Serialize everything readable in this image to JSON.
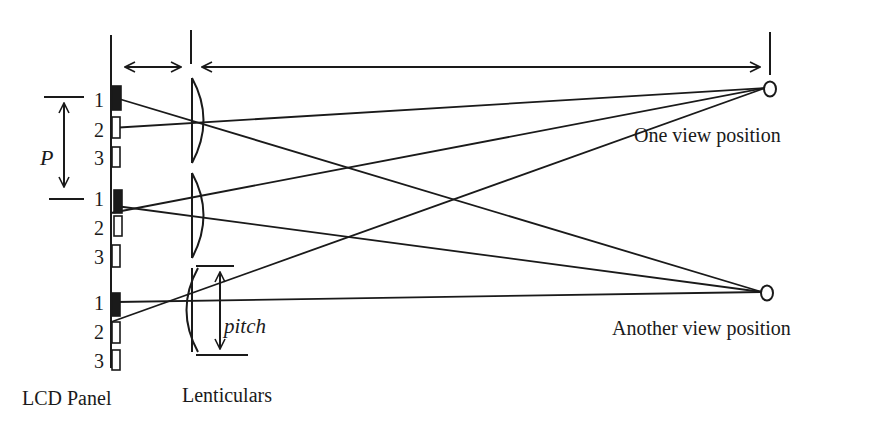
{
  "diagram": {
    "type": "lenticular-autostereoscopic-display-optics",
    "labels": {
      "lcd_panel": "LCD Panel",
      "lenticulars": "Lenticulars",
      "one_view": "One view position",
      "another_view": "Another view position",
      "pixel_period": "P",
      "lens_pitch": "pitch"
    },
    "pixel_numbers": [
      "1",
      "2",
      "3",
      "1",
      "2",
      "3",
      "1",
      "2",
      "3"
    ],
    "pixel_states": [
      "filled",
      "empty",
      "empty",
      "filled",
      "empty",
      "empty",
      "filled",
      "empty",
      "empty"
    ],
    "colors": {
      "ink": "#1a1a1a",
      "background": "#ffffff"
    }
  }
}
